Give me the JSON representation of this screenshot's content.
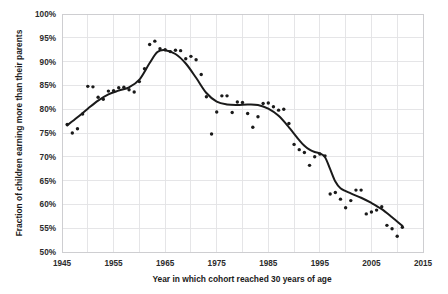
{
  "chart_data": {
    "type": "scatter",
    "title": "",
    "subtitle": "",
    "xlabel": "Year in which cohort reached 30 years of age",
    "ylabel": "Fraction of children earning more than their parents",
    "xlim": [
      1945,
      2015
    ],
    "ylim": [
      50,
      100
    ],
    "xticks": [
      1945,
      1955,
      1965,
      1975,
      1985,
      1995,
      2005,
      2015
    ],
    "xtick_labels": [
      "1945",
      "1955",
      "1965",
      "1975",
      "1985",
      "1995",
      "2005",
      "2015"
    ],
    "x_minor_gridlines": [
      1950,
      1960,
      1970,
      1980,
      1990,
      2000,
      2010
    ],
    "yticks": [
      50,
      55,
      60,
      65,
      70,
      75,
      80,
      85,
      90,
      95,
      100
    ],
    "ytick_labels": [
      "50%",
      "55%",
      "60%",
      "65%",
      "70%",
      "75%",
      "80%",
      "85%",
      "90%",
      "95%",
      "100%"
    ],
    "grid": true,
    "legend": null,
    "series": [
      {
        "name": "Cohort absolute mobility (observed)",
        "marker": "dot",
        "color": "#1a1a1a",
        "x": [
          1946,
          1947,
          1948,
          1949,
          1950,
          1951,
          1952,
          1953,
          1954,
          1955,
          1956,
          1957,
          1958,
          1959,
          1960,
          1961,
          1962,
          1963,
          1964,
          1965,
          1966,
          1967,
          1968,
          1969,
          1970,
          1971,
          1972,
          1973,
          1974,
          1975,
          1976,
          1977,
          1978,
          1979,
          1980,
          1981,
          1982,
          1983,
          1984,
          1985,
          1986,
          1987,
          1988,
          1989,
          1990,
          1991,
          1992,
          1993,
          1994,
          1995,
          1996,
          1997,
          1998,
          1999,
          2000,
          2001,
          2002,
          2003,
          2004,
          2005,
          2006,
          2007,
          2008,
          2009,
          2010,
          2011
        ],
        "y": [
          76.8,
          75.0,
          75.9,
          79.0,
          84.8,
          84.7,
          82.5,
          82.1,
          83.8,
          83.9,
          84.5,
          84.6,
          84.1,
          83.6,
          85.8,
          88.5,
          93.6,
          94.3,
          92.7,
          92.5,
          92.1,
          92.4,
          92.3,
          90.6,
          91.1,
          90.4,
          87.3,
          82.6,
          74.8,
          79.4,
          82.8,
          82.8,
          79.3,
          81.5,
          81.4,
          79.1,
          76.2,
          78.4,
          81.2,
          81.3,
          80.5,
          79.8,
          80.0,
          77.0,
          72.6,
          71.5,
          70.9,
          68.2,
          70.0,
          70.6,
          70.2,
          62.2,
          62.5,
          61.1,
          59.3,
          60.8,
          63.0,
          63.0,
          58.0,
          58.4,
          58.8,
          59.5,
          55.6,
          54.9,
          53.3,
          55.2
        ]
      }
    ],
    "trend_line": {
      "name": "Smoothed trend (LOWESS)",
      "color": "#1a1a1a",
      "x": [
        1946,
        1948,
        1950,
        1952,
        1954,
        1956,
        1958,
        1960,
        1962,
        1963.5,
        1965,
        1967,
        1969,
        1971,
        1973,
        1975,
        1977,
        1979,
        1981,
        1983,
        1985,
        1987,
        1989,
        1991,
        1992,
        1993,
        1994,
        1995,
        1996,
        1997,
        1998,
        1999,
        2001,
        2003,
        2005,
        2007,
        2009,
        2011
      ],
      "y": [
        76.6,
        78.3,
        80.1,
        81.8,
        83.1,
        83.9,
        84.6,
        86.2,
        89.7,
        92.0,
        92.4,
        91.6,
        89.6,
        86.6,
        83.4,
        81.6,
        81.0,
        80.9,
        81.0,
        80.9,
        80.1,
        78.6,
        76.2,
        73.5,
        72.3,
        71.5,
        71.0,
        70.7,
        69.9,
        67.4,
        64.8,
        63.4,
        62.3,
        61.4,
        60.3,
        59.0,
        57.3,
        55.5
      ]
    }
  }
}
